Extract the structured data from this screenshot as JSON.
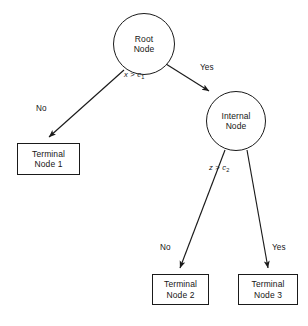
{
  "diagram": {
    "background_color": "#ffffff",
    "stroke_color": "#1a1a1a",
    "text_color": "#161616",
    "nodes": {
      "root": {
        "line1": "Root",
        "line2": "Node"
      },
      "internal": {
        "line1": "Internal",
        "line2": "Node"
      },
      "terminal1": {
        "line1": "Terminal",
        "line2": "Node 1"
      },
      "terminal2": {
        "line1": "Terminal",
        "line2": "Node 2"
      },
      "terminal3": {
        "line1": "Terminal",
        "line2": "Node 3"
      }
    },
    "conditions": {
      "root_split_var": "x",
      "root_split_op": " > ",
      "root_split_const": "c",
      "root_split_sub": "1",
      "internal_split_var": "z",
      "internal_split_op": " > ",
      "internal_split_const": "c",
      "internal_split_sub": "2"
    },
    "edge_labels": {
      "root_no": "No",
      "root_yes": "Yes",
      "internal_no": "No",
      "internal_yes": "Yes"
    }
  }
}
